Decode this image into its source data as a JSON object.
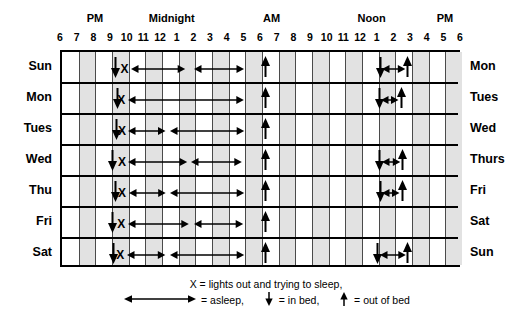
{
  "axis": {
    "period_labels": [
      {
        "text": "PM",
        "hour_index": 1.6
      },
      {
        "text": "Midnight",
        "hour_index": 6.2
      },
      {
        "text": "AM",
        "hour_index": 12.2
      },
      {
        "text": "Noon",
        "hour_index": 18.2
      },
      {
        "text": "PM",
        "hour_index": 22.6
      }
    ],
    "hour_ticks": [
      "6",
      "7",
      "8",
      "9",
      "10",
      "11",
      "12",
      "1",
      "2",
      "3",
      "4",
      "5",
      "6",
      "7",
      "8",
      "9",
      "10",
      "11",
      "12",
      "1",
      "2",
      "3",
      "4",
      "5",
      "6"
    ],
    "start_hour_label": "6",
    "hours_span": 24
  },
  "rows": [
    {
      "left_label": "Sun",
      "right_label": "Mon"
    },
    {
      "left_label": "Mon",
      "right_label": "Tues"
    },
    {
      "left_label": "Tues",
      "right_label": "Wed"
    },
    {
      "left_label": "Wed",
      "right_label": "Thurs"
    },
    {
      "left_label": "Thu",
      "right_label": "Fri"
    },
    {
      "left_label": "Fri",
      "right_label": "Sat"
    },
    {
      "left_label": "Sat",
      "right_label": "Sun"
    }
  ],
  "chart_data": {
    "type": "table",
    "xlabel": "Time of day",
    "ylabel": "Day of week",
    "xlim": [
      0,
      24
    ],
    "x_origin_clock": "6 PM",
    "grid": true,
    "legend_position": "bottom",
    "categories": [
      "Sun",
      "Mon",
      "Tues",
      "Wed",
      "Thu",
      "Fri",
      "Sat"
    ],
    "end_categories": [
      "Mon",
      "Tues",
      "Wed",
      "Thurs",
      "Fri",
      "Sat",
      "Sun"
    ],
    "marker_types": {
      "in_bed": "down-arrow",
      "out_of_bed": "up-arrow",
      "lights_out": "X",
      "asleep": "double-headed-arrow"
    },
    "series": [
      {
        "name": "Sun",
        "in_bed": [
          3.2
        ],
        "lights_out": [
          3.75
        ],
        "out_of_bed": [
          12.2
        ],
        "asleep": [
          [
            4.15,
            7.4
          ],
          [
            7.9,
            10.9
          ]
        ],
        "naps": [
          {
            "in_bed": 19.1,
            "asleep": [
              19.2,
              20.6
            ],
            "out_of_bed": 20.75
          }
        ]
      },
      {
        "name": "Mon",
        "in_bed": [
          3.3
        ],
        "lights_out": [
          3.55
        ],
        "out_of_bed": [
          12.2
        ],
        "asleep": [
          [
            3.95,
            10.9
          ]
        ],
        "naps": [
          {
            "in_bed": 19.05,
            "asleep": [
              19.15,
              20.2
            ],
            "out_of_bed": 20.35
          }
        ]
      },
      {
        "name": "Tues",
        "in_bed": [
          3.25
        ],
        "lights_out": [
          3.6
        ],
        "out_of_bed": [
          12.2
        ],
        "asleep": [
          [
            3.95,
            6.2
          ],
          [
            6.45,
            10.9
          ]
        ],
        "naps": []
      },
      {
        "name": "Wed",
        "in_bed": [
          3.05
        ],
        "lights_out": [
          3.6
        ],
        "out_of_bed": [
          12.2
        ],
        "asleep": [
          [
            3.95,
            7.5
          ],
          [
            7.75,
            10.8
          ]
        ],
        "naps": [
          {
            "in_bed": 19.05,
            "asleep": [
              19.2,
              20.3
            ],
            "out_of_bed": 20.45
          }
        ]
      },
      {
        "name": "Thu",
        "in_bed": [
          3.2
        ],
        "lights_out": [
          3.6
        ],
        "out_of_bed": [
          12.2
        ],
        "asleep": [
          [
            4.0,
            6.2
          ],
          [
            6.45,
            10.9
          ]
        ],
        "naps": [
          {
            "in_bed": 19.1,
            "asleep": [
              19.2,
              20.25
            ],
            "out_of_bed": 20.4
          }
        ]
      },
      {
        "name": "Fri",
        "in_bed": [
          3.05
        ],
        "lights_out": [
          3.55
        ],
        "out_of_bed": [
          12.2
        ],
        "asleep": [
          [
            3.95,
            7.6
          ],
          [
            7.9,
            10.85
          ]
        ],
        "naps": []
      },
      {
        "name": "Sat",
        "in_bed": [
          3.1
        ],
        "lights_out": [
          3.5
        ],
        "out_of_bed": [
          12.2
        ],
        "asleep": [
          [
            3.9,
            6.2
          ],
          [
            6.45,
            10.9
          ]
        ],
        "naps": [
          {
            "in_bed": 18.9,
            "asleep": [
              19.05,
              20.6
            ],
            "out_of_bed": 20.75
          }
        ]
      }
    ]
  },
  "legend": {
    "line1": "X = lights out and trying to sleep,",
    "asleep_label": "= asleep,",
    "in_bed_label": "= in bed,",
    "out_of_bed_label": "= out of bed"
  },
  "colors": {
    "ink": "#000000",
    "shade": "#e2e2e2",
    "gridline": "#4a4a4a",
    "background": "#ffffff"
  }
}
